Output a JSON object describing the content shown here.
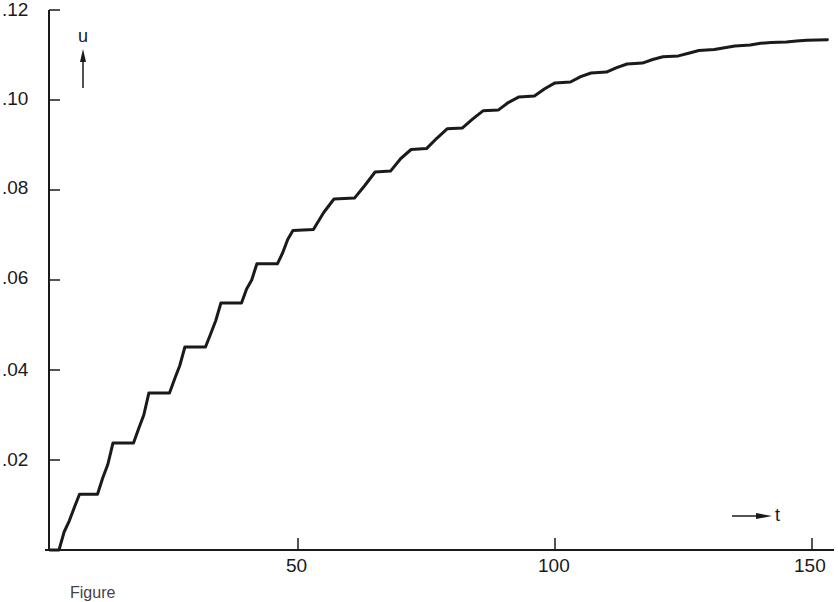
{
  "chart_data": {
    "type": "line",
    "title": "",
    "xlabel": "t",
    "ylabel": "u",
    "xlim": [
      0,
      154
    ],
    "ylim": [
      0,
      0.12
    ],
    "grid": false,
    "legend": null,
    "x_ticks": [
      50,
      100,
      150
    ],
    "x_tick_labels": [
      "50",
      "100",
      "150"
    ],
    "y_ticks": [
      0.02,
      0.04,
      0.06,
      0.08,
      0.1,
      0.12
    ],
    "y_tick_labels": [
      ".02",
      ".04",
      ".06",
      ".08",
      ".10",
      ".12"
    ],
    "series": [
      {
        "name": "u(t)",
        "style": "staircase-ripple",
        "x": [
          0,
          3.5,
          4.5,
          5.5,
          6.5,
          7.5,
          11,
          12,
          13,
          14,
          18,
          19,
          20,
          21,
          25,
          26,
          27,
          28,
          32,
          33,
          34,
          35,
          39,
          40,
          41,
          42,
          46,
          47,
          48,
          49,
          53,
          55,
          57,
          61,
          63,
          65,
          68,
          70,
          72,
          75,
          77,
          79,
          82,
          84,
          86,
          89,
          91,
          93,
          96,
          98,
          100,
          103,
          105,
          107,
          110,
          112,
          114,
          117,
          119,
          121,
          124,
          126,
          128,
          131,
          133,
          135,
          138,
          140,
          142,
          145,
          147,
          149,
          153
        ],
        "y": [
          0,
          0,
          0.004,
          0.0065,
          0.0095,
          0.0124,
          0.0124,
          0.016,
          0.019,
          0.0238,
          0.0238,
          0.027,
          0.03,
          0.0349,
          0.0349,
          0.038,
          0.041,
          0.0451,
          0.0451,
          0.048,
          0.051,
          0.0549,
          0.0549,
          0.058,
          0.06,
          0.0636,
          0.0636,
          0.066,
          0.069,
          0.071,
          0.0712,
          0.075,
          0.078,
          0.0782,
          0.081,
          0.084,
          0.0842,
          0.087,
          0.089,
          0.0892,
          0.0915,
          0.0936,
          0.0938,
          0.0958,
          0.0976,
          0.0978,
          0.0995,
          0.1007,
          0.1009,
          0.1025,
          0.1038,
          0.104,
          0.1052,
          0.106,
          0.1062,
          0.1072,
          0.108,
          0.1082,
          0.109,
          0.1096,
          0.1098,
          0.1104,
          0.111,
          0.1112,
          0.1116,
          0.112,
          0.1122,
          0.1126,
          0.1128,
          0.1129,
          0.1131,
          0.1133,
          0.1134
        ]
      }
    ],
    "annotations": [
      {
        "text": "u",
        "arrow": "up",
        "position": "top-left"
      },
      {
        "text": "t",
        "arrow": "right",
        "position": "bottom-right"
      }
    ]
  },
  "axes": {
    "y_labels": [
      ".12",
      ".10",
      ".08",
      ".06",
      ".04",
      ".02"
    ],
    "x_labels": [
      "50",
      "100",
      "150"
    ],
    "u_label": "u",
    "t_label": "t"
  },
  "caption": "Figure"
}
